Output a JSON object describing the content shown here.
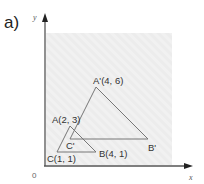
{
  "part_label": "a)",
  "axes": {
    "x_label": "x",
    "y_label": "y",
    "origin_label": "0"
  },
  "colors": {
    "plot_bg": "#ececec",
    "axis": "#555555",
    "triangle": "#777777",
    "text": "#333333"
  },
  "grid": {
    "origin_px": [
      44,
      165
    ],
    "unit_px": 13
  },
  "triangles": [
    {
      "name": "ABC",
      "vertices": [
        {
          "id": "A",
          "label": "A(2, 3)",
          "x": 2,
          "y": 3
        },
        {
          "id": "B",
          "label": "B(4, 1)",
          "x": 4,
          "y": 1
        },
        {
          "id": "C",
          "label": "C(1, 1)",
          "x": 1,
          "y": 1
        }
      ]
    },
    {
      "name": "A'B'C'",
      "vertices": [
        {
          "id": "A'",
          "label": "A'(4, 6)",
          "x": 4,
          "y": 6
        },
        {
          "id": "B'",
          "label": "B'",
          "x": 8,
          "y": 2
        },
        {
          "id": "C'",
          "label": "C'",
          "x": 2,
          "y": 2
        }
      ]
    }
  ]
}
